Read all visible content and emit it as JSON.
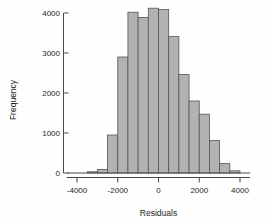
{
  "chart_data": {
    "type": "bar",
    "title": "",
    "subtitle": "",
    "xlabel": "Residuals",
    "ylabel": "Frequency",
    "xlim": [
      -4500,
      4500
    ],
    "ylim": [
      0,
      4300
    ],
    "xticks": [
      -4000,
      -2000,
      0,
      2000,
      4000
    ],
    "xtick_labels": [
      "-4000",
      "-2000",
      "0",
      "2000",
      "4000"
    ],
    "yticks": [
      0,
      1000,
      2000,
      3000,
      4000
    ],
    "ytick_labels": [
      "0",
      "1000",
      "2000",
      "3000",
      "4000"
    ],
    "grid": false,
    "legend": false,
    "bin_width": 500,
    "bar_color": "#b2b2b2",
    "bar_edge_color": "#555555",
    "bin_edges": [
      -3500,
      -3000,
      -2500,
      -2000,
      -1500,
      -1000,
      -500,
      0,
      500,
      1000,
      1500,
      2000,
      2500,
      3000,
      3500,
      4000
    ],
    "categories": [
      "-3250",
      "-2750",
      "-2250",
      "-1750",
      "-1250",
      "-750",
      "-250",
      "250",
      "750",
      "1250",
      "1750",
      "2250",
      "2750",
      "3250",
      "3750"
    ],
    "values": [
      30,
      90,
      950,
      2900,
      4020,
      3890,
      4120,
      4090,
      3410,
      2460,
      1800,
      1470,
      810,
      235,
      55
    ]
  }
}
